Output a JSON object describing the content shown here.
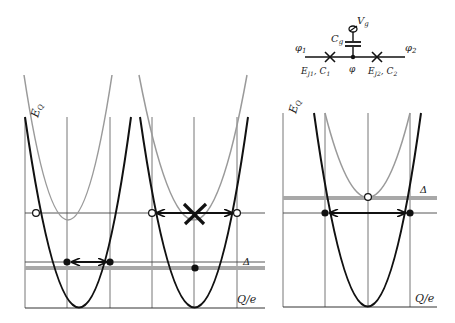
{
  "circuit": {
    "phi1": "φ₁",
    "phi2": "φ₂",
    "phi": "φ",
    "gate_voltage": "Vg",
    "gate_capacitance": "Cg",
    "junction1": "EJ1, C1",
    "junction2": "EJ2, C2"
  },
  "left_panel": {
    "y_axis_label": "E_Q",
    "x_axis_label": "Q/e",
    "gap_label": "Δ"
  },
  "right_panel": {
    "y_axis_label": "E_Q",
    "x_axis_label": "Q/e",
    "gap_label": "Δ"
  },
  "colors": {
    "black_curve": "#111111",
    "gray_curve": "#9a9a9a",
    "gap_band": "#a8a8a8",
    "grid": "#555555"
  }
}
